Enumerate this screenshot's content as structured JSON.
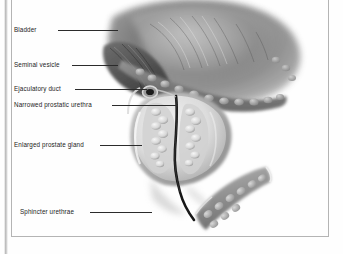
{
  "figure": {
    "background_color": "#fefefe",
    "frame_color": "#b4b4b4",
    "label_color": "#1b1b1b",
    "leader_color": "#2b2b2b"
  },
  "labels": [
    {
      "id": "bladder",
      "text": "Bladder",
      "x": 14,
      "y": 27,
      "leader_x": 58,
      "leader_y": 30,
      "leader_w": 60
    },
    {
      "id": "seminal-vesicle",
      "text": "Seminal vesicle",
      "x": 14,
      "y": 62,
      "leader_x": 72,
      "leader_y": 65,
      "leader_w": 46
    },
    {
      "id": "ejaculatory-duct",
      "text": "Ejaculatory duct",
      "x": 14,
      "y": 86,
      "leader_x": 75,
      "leader_y": 89,
      "leader_w": 72
    },
    {
      "id": "prostatic-urethra",
      "text": "Narrowed prostatic urethra",
      "x": 14,
      "y": 102,
      "leader_x": 112,
      "leader_y": 105,
      "leader_w": 66
    },
    {
      "id": "prostate-gland",
      "text": "Enlarged prostate gland",
      "x": 14,
      "y": 142,
      "leader_x": 100,
      "leader_y": 145,
      "leader_w": 42
    },
    {
      "id": "sphincter-urethrae",
      "text": "Sphincter urethrae",
      "x": 20,
      "y": 209,
      "leader_x": 90,
      "leader_y": 212,
      "leader_w": 62
    }
  ],
  "structures": {
    "bladder": "large soft-edged dark mass occupying upper right of field",
    "seminal_vesicle": "lobulated body lying beneath and left of the bladder base",
    "ejaculatory_duct": "small ringed opening at the prostate base",
    "prostatic_urethra": "narrow dark channel compressed between hyperplastic lobes",
    "prostate_gland": "enlarged ovoid gland with two nodular lobes",
    "sphincter_urethrae": "diagonal striated muscle band below and right of prostate apex"
  }
}
